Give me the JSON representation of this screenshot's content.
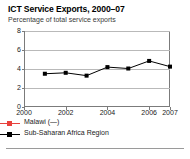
{
  "header": {
    "title": "ICT Service Exports, 2000–07",
    "subtitle": "Percentage of total service exports"
  },
  "legend": [
    {
      "label": "Malawi (—)",
      "color": "#e8413c",
      "marker": "square-line",
      "icon": "legend-line-marker"
    },
    {
      "label": "Sub-Saharan Africa Region",
      "color": "#000000",
      "marker": "square-line",
      "icon": "legend-line-marker"
    }
  ],
  "axes": {
    "y_ticks": [
      "8",
      "6",
      "4",
      "2",
      "0"
    ],
    "x_ticks": [
      "2000",
      "2002",
      "2004",
      "2006",
      "2007"
    ]
  },
  "chart_data": {
    "type": "line",
    "title": "ICT Service Exports, 2000–07",
    "subtitle": "Percentage of total service exports",
    "xlabel": "",
    "ylabel": "Percentage of total service exports",
    "ylim": [
      0,
      8
    ],
    "yticks": [
      0,
      2,
      4,
      6,
      8
    ],
    "xlim": [
      2000,
      2007
    ],
    "xticks": [
      2000,
      2002,
      2004,
      2006,
      2007
    ],
    "grid": true,
    "legend_position": "bottom",
    "x": [
      2001,
      2002,
      2003,
      2004,
      2005,
      2006,
      2007
    ],
    "series": [
      {
        "name": "Malawi (—)",
        "color": "#e8413c",
        "values": [
          null,
          null,
          null,
          null,
          null,
          null,
          null
        ],
        "note": "no data"
      },
      {
        "name": "Sub-Saharan Africa Region",
        "color": "#000000",
        "values": [
          3.5,
          3.6,
          3.3,
          4.2,
          4.05,
          4.85,
          4.25
        ]
      }
    ]
  }
}
